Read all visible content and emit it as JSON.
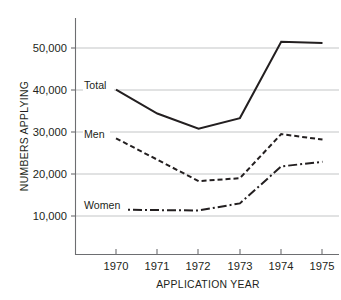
{
  "chart_data": {
    "type": "line",
    "title": "",
    "xlabel": "APPLICATION YEAR",
    "ylabel": "NUMBERS APPLYING",
    "x": [
      1970,
      1971,
      1972,
      1973,
      1974,
      1975
    ],
    "xtick_labels": [
      "1970",
      "1971",
      "1972",
      "1973",
      "1974",
      "1975"
    ],
    "ytick_labels": [
      "10,000",
      "20,000",
      "30,000",
      "40,000",
      "50,000"
    ],
    "ytick_values": [
      10000,
      20000,
      30000,
      40000,
      50000
    ],
    "ylim": [
      4000,
      56000
    ],
    "xlim": [
      1969.0,
      1975.45
    ],
    "grid": "horizontal",
    "legend": "inline-labels",
    "series": [
      {
        "name": "Total",
        "style": "solid",
        "color": "#231f20",
        "values": [
          40100,
          34400,
          30800,
          33300,
          51500,
          51200
        ]
      },
      {
        "name": "Men",
        "style": "dashed",
        "color": "#231f20",
        "values": [
          28500,
          23400,
          18300,
          19000,
          29500,
          28200
        ]
      },
      {
        "name": "Women",
        "style": "dash-dot",
        "color": "#231f20",
        "values": [
          11500,
          11400,
          11300,
          13000,
          21800,
          22900
        ]
      }
    ],
    "annotations": [
      {
        "text": "Total",
        "x": 1970,
        "y": 40100
      },
      {
        "text": "Men",
        "x": 1970,
        "y": 28500
      },
      {
        "text": "Women",
        "x": 1970,
        "y": 11500
      }
    ]
  },
  "axis": {
    "y_title": "NUMBERS APPLYING",
    "x_title": "APPLICATION YEAR"
  }
}
